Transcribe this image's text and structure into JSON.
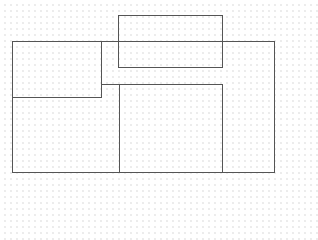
{
  "canvas": {
    "width": 288,
    "height": 178,
    "background": "#ffffff",
    "grid": "dotted",
    "stroke_color": "#555555"
  },
  "shapes": [
    {
      "name": "outer-frame",
      "x": 12,
      "y": 41,
      "w": 263,
      "h": 132
    },
    {
      "name": "top-left-box",
      "x": 12,
      "y": 41,
      "w": 90,
      "h": 57
    },
    {
      "name": "top-center-box",
      "x": 118,
      "y": 15,
      "w": 105,
      "h": 53
    },
    {
      "name": "bottom-center-box",
      "x": 119,
      "y": 84,
      "w": 104,
      "h": 89
    }
  ]
}
